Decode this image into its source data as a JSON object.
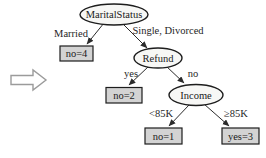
{
  "diagram": {
    "type": "decision-tree",
    "colors": {
      "background": "#ffffff",
      "decision_fill": "#f7f7f5",
      "leaf_fill": "#d3d3d3",
      "edge_color": "#2b2b2b",
      "arrow_fill": "#ffffff"
    },
    "nodes": {
      "root": {
        "label": "MaritalStatus",
        "type": "decision"
      },
      "refund": {
        "label": "Refund",
        "type": "decision"
      },
      "income": {
        "label": "Income",
        "type": "decision"
      },
      "leaf_married": {
        "label": "no=4",
        "type": "leaf"
      },
      "leaf_refund_yes": {
        "label": "no=2",
        "type": "leaf"
      },
      "leaf_income_low": {
        "label": "no=1",
        "type": "leaf"
      },
      "leaf_income_high": {
        "label": "yes=3",
        "type": "leaf"
      }
    },
    "edge_labels": {
      "married": "Married",
      "single_divorced": "Single, Divorced",
      "refund_yes": "yes",
      "refund_no": "no",
      "income_low": "<85K",
      "income_high": "≥85K"
    }
  }
}
